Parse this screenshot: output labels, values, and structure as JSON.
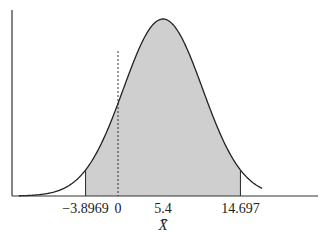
{
  "chart_data": {
    "type": "area",
    "title": "",
    "xlabel": "X̄",
    "ylabel": "",
    "distribution": {
      "mean": 5.4,
      "sd": 4.744
    },
    "shaded_region": {
      "from": -3.8969,
      "to": 14.697
    },
    "reference_line": {
      "x": 0,
      "style": "dashed"
    },
    "tick_labels": [
      {
        "value": -3.8969,
        "label": "−3.8969"
      },
      {
        "value": 0,
        "label": "0"
      },
      {
        "value": 5.4,
        "label": "5.4"
      },
      {
        "value": 14.697,
        "label": "14.697"
      }
    ],
    "xlim": [
      -11.9,
      17.3
    ],
    "grid": false,
    "legend": null
  },
  "colors": {
    "curve": "#222222",
    "fill": "#cfcfcf",
    "axis": "#333333"
  }
}
